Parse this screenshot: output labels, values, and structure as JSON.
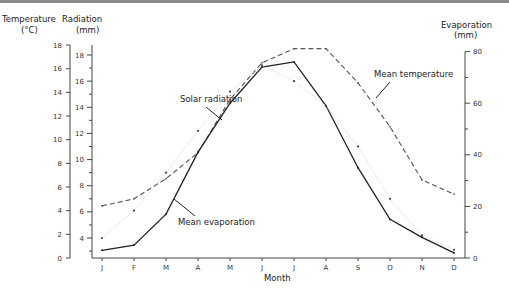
{
  "chart_data": {
    "type": "line",
    "title": "",
    "xlabel": "Month",
    "categories": [
      "J",
      "F",
      "M",
      "A",
      "M",
      "J",
      "J",
      "A",
      "S",
      "O",
      "N",
      "D"
    ],
    "axes": {
      "temperature": {
        "label_line1": "Temperature",
        "label_line2": "(°C)",
        "range": [
          0,
          18
        ],
        "ticks": [
          0,
          2,
          4,
          6,
          8,
          10,
          12,
          14,
          16,
          18
        ],
        "position": "left-outer"
      },
      "radiation": {
        "label_line1": "Radiation",
        "label_line2": "(mm)",
        "range": [
          2.5,
          19
        ],
        "ticks": [
          4,
          6,
          8,
          10,
          12,
          14,
          16,
          18
        ],
        "position": "left-inner"
      },
      "evaporation": {
        "label_line1": "Evaporation",
        "label_line2": "(mm)",
        "range": [
          0,
          80
        ],
        "ticks": [
          0,
          20,
          40,
          60,
          80
        ],
        "position": "right"
      }
    },
    "series": [
      {
        "name": "Mean temperature",
        "axis": "temperature",
        "style": "dashed",
        "values": [
          4.4,
          5.0,
          6.7,
          8.9,
          13.4,
          16.5,
          17.7,
          17.7,
          14.8,
          11.1,
          6.6,
          5.4
        ]
      },
      {
        "name": "Mean evaporation",
        "axis": "evaporation",
        "style": "solid",
        "values": [
          3,
          5,
          17,
          41,
          60,
          74,
          76,
          59,
          35,
          15,
          8,
          2
        ]
      },
      {
        "name": "Solar radiation",
        "axis": "radiation",
        "style": "dotted-with-points",
        "values": [
          4.0,
          6.1,
          9.0,
          12.2,
          15.2,
          17.2,
          16.0,
          14.1,
          11.0,
          7.0,
          4.2,
          3.1
        ]
      }
    ],
    "annotations": [
      "Solar radiation",
      "Mean temperature",
      "Mean evaporation"
    ],
    "legend": "none (inline annotations)",
    "grid": false
  },
  "labels": {
    "temp_axis_1": "Temperature",
    "temp_axis_2": "(°C)",
    "rad_axis_1": "Radiation",
    "rad_axis_2": "(mm)",
    "evap_axis_1": "Evaporation",
    "evap_axis_2": "(mm)",
    "xlabel": "Month",
    "ann_solar": "Solar radiation",
    "ann_temp": "Mean temperature",
    "ann_evap": "Mean evaporation"
  }
}
